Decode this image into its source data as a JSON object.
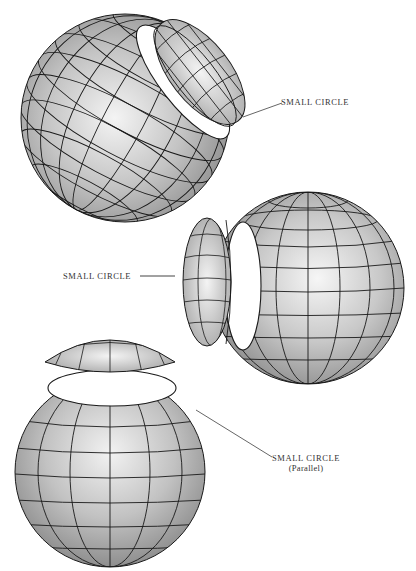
{
  "figure": {
    "colors": {
      "background": "#ffffff",
      "grid_line": "#1a1a1a",
      "shade_light": "#f2f2f2",
      "shade_dark": "#8a8a8a",
      "leader_line": "#666666"
    }
  },
  "labels": {
    "top": {
      "text": "SMALL CIRCLE"
    },
    "middle": {
      "text": "SMALL CIRCLE"
    },
    "bottom": {
      "text": "SMALL CIRCLE",
      "subtext": "(Parallel)"
    }
  },
  "diagrams": [
    {
      "name": "oblique-small-circle",
      "cut": "diagonal upper-right",
      "label_ref": "labels.top"
    },
    {
      "name": "lateral-small-circle",
      "cut": "left side",
      "label_ref": "labels.middle"
    },
    {
      "name": "parallel-small-circle",
      "cut": "top",
      "label_ref": "labels.bottom"
    }
  ]
}
